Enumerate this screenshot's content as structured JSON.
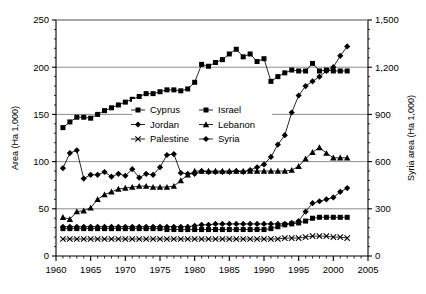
{
  "chart_data": {
    "type": "line",
    "title": "",
    "xlabel": "",
    "ylabel": "Area (Ha 1,000)",
    "y2label": "Syria area (Ha 1,000)",
    "xlim": [
      1960,
      2005
    ],
    "ylim": [
      0,
      250
    ],
    "y2lim": [
      0,
      1500
    ],
    "xticks": [
      1960,
      1965,
      1970,
      1975,
      1980,
      1985,
      1990,
      1995,
      2000,
      2005
    ],
    "xtick_labels": [
      "1960",
      "1965",
      "1970",
      "1975",
      "1980",
      "1985",
      "1990",
      "1995",
      "2000",
      "2005"
    ],
    "yticks": [
      0,
      50,
      100,
      150,
      200,
      250
    ],
    "ytick_labels": [
      "0",
      "50",
      "100",
      "150",
      "200",
      "250"
    ],
    "y2ticks": [
      0,
      300,
      600,
      900,
      1200,
      1500
    ],
    "y2tick_labels": [
      "0",
      "300",
      "600",
      "900",
      "1,200",
      "1,500"
    ],
    "grid": true,
    "grid_axis": "y",
    "minor_xticks": true,
    "legend_position": "center-left-inside",
    "legend_columns": 2,
    "x": [
      1961,
      1962,
      1963,
      1964,
      1965,
      1966,
      1967,
      1968,
      1969,
      1970,
      1971,
      1972,
      1973,
      1974,
      1975,
      1976,
      1977,
      1978,
      1979,
      1980,
      1981,
      1982,
      1983,
      1984,
      1985,
      1986,
      1987,
      1988,
      1989,
      1990,
      1991,
      1992,
      1993,
      1994,
      1995,
      1996,
      1997,
      1998,
      1999,
      2000,
      2001,
      2002
    ],
    "series": [
      {
        "name": "Israel",
        "marker": "square",
        "axis": "left",
        "values": [
          136,
          142,
          147,
          147,
          146,
          150,
          154,
          157,
          160,
          163,
          166,
          169,
          172,
          172,
          174,
          176,
          176,
          175,
          177,
          184,
          203,
          201,
          205,
          208,
          214,
          219,
          211,
          214,
          206,
          209,
          185,
          190,
          194,
          197,
          196,
          196,
          204,
          196,
          197,
          196,
          196,
          196
        ]
      },
      {
        "name": "Syria",
        "marker": "diamond",
        "axis": "right",
        "values": [
          93,
          109,
          112,
          82,
          86,
          86,
          89,
          84,
          87,
          85,
          92,
          83,
          87,
          86,
          94,
          107,
          108,
          88,
          87,
          87,
          90,
          89,
          89,
          89,
          89,
          90,
          89,
          91,
          94,
          97,
          105,
          118,
          128,
          152,
          170,
          180,
          185,
          190,
          196,
          200,
          212,
          222
        ]
      },
      {
        "name": "Lebanon",
        "marker": "triangle",
        "axis": "left",
        "values": [
          41,
          39,
          47,
          48,
          51,
          60,
          65,
          68,
          71,
          72,
          73,
          74,
          74,
          73,
          73,
          73,
          74,
          80,
          86,
          90,
          90,
          90,
          90,
          90,
          90,
          90,
          90,
          90,
          90,
          90,
          90,
          90,
          90,
          91,
          95,
          103,
          110,
          115,
          109,
          104,
          104,
          104
        ]
      },
      {
        "name": "Jordan",
        "marker": "diamond",
        "axis": "left",
        "values": [
          31,
          31,
          31,
          31,
          31,
          31,
          31,
          31,
          31,
          31,
          31,
          31,
          31,
          31,
          31,
          31,
          31,
          31,
          31,
          32,
          33,
          33,
          34,
          34,
          34,
          34,
          34,
          34,
          34,
          34,
          34,
          34,
          34,
          35,
          37,
          47,
          56,
          58,
          60,
          62,
          68,
          72
        ]
      },
      {
        "name": "Cyprus",
        "marker": "square",
        "axis": "left",
        "values": [
          29,
          29,
          29,
          29,
          29,
          29,
          29,
          29,
          29,
          29,
          29,
          29,
          29,
          29,
          29,
          28,
          28,
          28,
          28,
          28,
          28,
          28,
          28,
          28,
          28,
          28,
          28,
          28,
          28,
          28,
          29,
          31,
          33,
          34,
          35,
          37,
          40,
          41,
          41,
          41,
          41,
          41
        ]
      },
      {
        "name": "Palestine",
        "marker": "x",
        "axis": "left",
        "values": [
          18,
          18,
          18,
          18,
          18,
          18,
          18,
          18,
          18,
          18,
          18,
          18,
          18,
          18,
          18,
          18,
          18,
          18,
          18,
          18,
          18,
          18,
          18,
          18,
          18,
          18,
          18,
          18,
          18,
          18,
          18,
          18,
          19,
          19,
          19,
          20,
          21,
          21,
          21,
          20,
          20,
          19
        ]
      }
    ],
    "legend": [
      {
        "label": "Cyprus",
        "marker": "square"
      },
      {
        "label": "Israel",
        "marker": "square"
      },
      {
        "label": "Jordan",
        "marker": "diamond"
      },
      {
        "label": "Lebanon",
        "marker": "triangle"
      },
      {
        "label": "Palestine",
        "marker": "x"
      },
      {
        "label": "Syria",
        "marker": "diamond"
      }
    ],
    "colors": {
      "line": "#000000",
      "grid": "#808080",
      "axis": "#000000",
      "background": "#ffffff"
    }
  }
}
